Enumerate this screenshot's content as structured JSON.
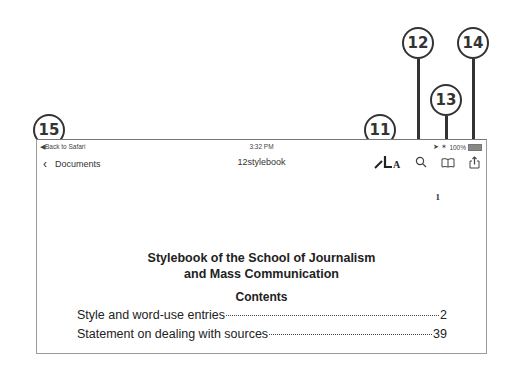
{
  "status_bar": {
    "back_to_app": "◀Back to Safari",
    "time": "3:32 PM",
    "battery": "100%"
  },
  "nav_bar": {
    "back_label": "Documents",
    "back_chevron": "‹",
    "document_title": "12stylebook",
    "icons": [
      "markup-icon",
      "search-icon",
      "bookmarks-book-icon",
      "share-icon"
    ]
  },
  "document": {
    "page_number": "1",
    "title_line1": "Stylebook of the School of Journalism",
    "title_line2": "and Mass Communication",
    "contents_heading": "Contents",
    "toc": [
      {
        "label": "Style and word-use entries",
        "page": "2"
      },
      {
        "label": "Statement on dealing with sources",
        "page": "39"
      }
    ]
  },
  "callouts": [
    {
      "number": "11",
      "target": "markup-icon"
    },
    {
      "number": "12",
      "target": "search-icon"
    },
    {
      "number": "13",
      "target": "bookmarks-book-icon"
    },
    {
      "number": "14",
      "target": "share-icon"
    },
    {
      "number": "15",
      "target": "back-to-safari"
    }
  ]
}
